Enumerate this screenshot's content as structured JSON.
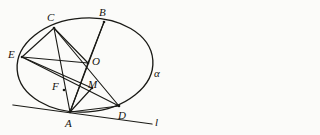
{
  "figure": {
    "background_color": "#fbfbf9",
    "stroke_color": "#1a1a16",
    "conic": {
      "type": "ellipse",
      "label": "alpha",
      "center": [
        85,
        65
      ],
      "radius_x": 68,
      "radius_y": 47,
      "rotation_deg": -4
    },
    "points": [
      {
        "name": "C",
        "label": "C",
        "x": 54,
        "y": 28,
        "label_x": 47,
        "label_y": 12
      },
      {
        "name": "B",
        "label": "B",
        "x": 104,
        "y": 22,
        "label_x": 99,
        "label_y": 7
      },
      {
        "name": "E",
        "label": "E",
        "x": 22,
        "y": 57,
        "label_x": 8,
        "label_y": 49
      },
      {
        "name": "O",
        "label": "O",
        "x": 88,
        "y": 63,
        "label_x": 92,
        "label_y": 56
      },
      {
        "name": "F",
        "label": "F",
        "x": 64,
        "y": 90,
        "label_x": 52,
        "label_y": 81
      },
      {
        "name": "M",
        "label": "M",
        "x": 92,
        "y": 88,
        "label_x": 88,
        "label_y": 79
      },
      {
        "name": "A",
        "label": "A",
        "x": 70,
        "y": 112,
        "label_x": 65,
        "label_y": 118
      },
      {
        "name": "D",
        "label": "D",
        "x": 119,
        "y": 106,
        "label_x": 118,
        "label_y": 110
      }
    ],
    "segments": [
      {
        "name": "segment-C-E",
        "from": "C",
        "to": "E"
      },
      {
        "name": "segment-C-A",
        "from": "C",
        "to": "A"
      },
      {
        "name": "segment-C-D",
        "from": "C",
        "to": "D"
      },
      {
        "name": "segment-C-O",
        "from": "C",
        "to": "O"
      },
      {
        "name": "segment-B-O",
        "from": "B",
        "to": "O"
      },
      {
        "name": "segment-B-A",
        "from": "B",
        "to": "A"
      },
      {
        "name": "segment-E-O",
        "from": "E",
        "to": "O"
      },
      {
        "name": "segment-E-M",
        "from": "E",
        "to": "M"
      },
      {
        "name": "segment-E-D",
        "from": "E",
        "to": "D"
      },
      {
        "name": "segment-O-A",
        "from": "O",
        "to": "A"
      },
      {
        "name": "segment-A-M",
        "from": "A",
        "to": "M"
      },
      {
        "name": "segment-A-D",
        "from": "A",
        "to": "D"
      }
    ],
    "tangent_line": {
      "name": "tangent-line-l",
      "label": "l",
      "x1": 13,
      "y1": 105,
      "x2": 152,
      "y2": 124,
      "label_x": 155,
      "label_y": 117
    },
    "conic_label": {
      "text": "α",
      "x": 154,
      "y": 68
    }
  }
}
